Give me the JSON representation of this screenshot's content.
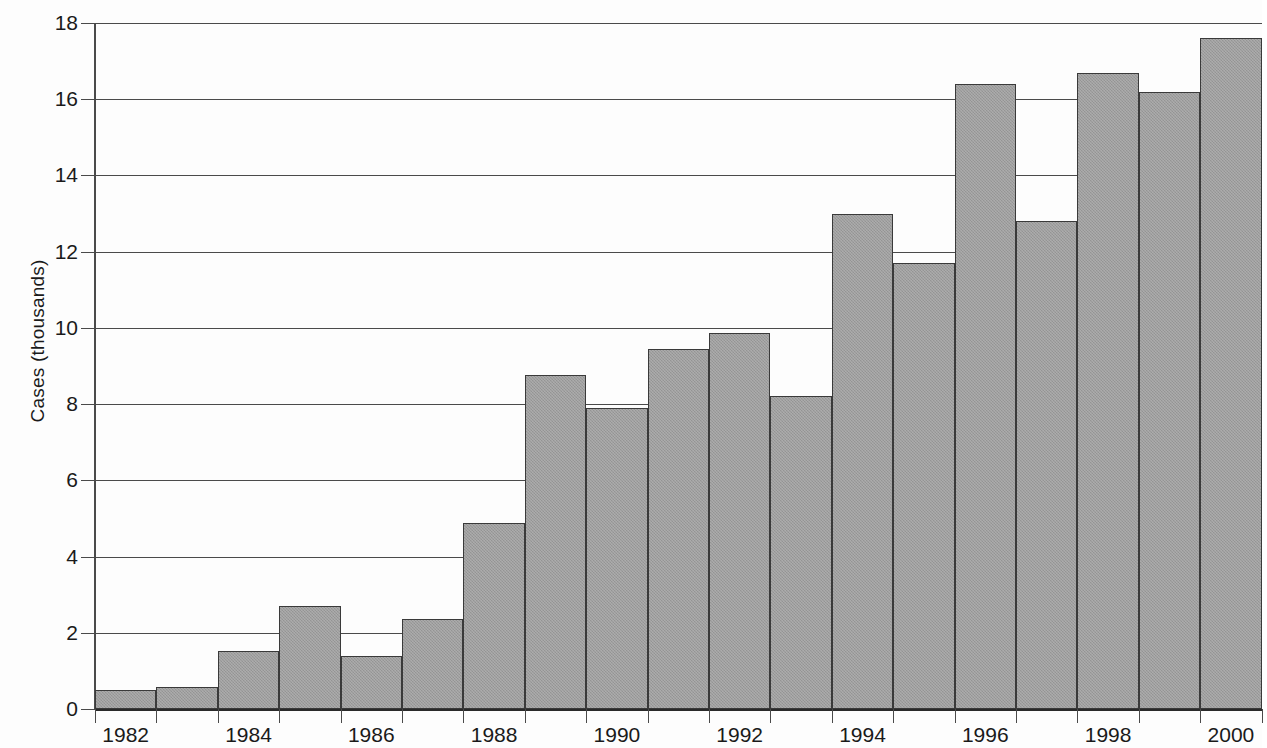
{
  "chart_data": {
    "type": "bar",
    "title": "",
    "xlabel": "",
    "ylabel": "Cases (thousands)",
    "ylim": [
      0,
      18
    ],
    "y_ticks": [
      0,
      2,
      4,
      6,
      8,
      10,
      12,
      14,
      16,
      18
    ],
    "y_tick_labels": [
      "0",
      "2",
      "4",
      "6",
      "8",
      "10",
      "12",
      "14",
      "16",
      "18"
    ],
    "grid": "horizontal",
    "legend": "none",
    "note": "right-most bar (2000) is clipped by the image edge",
    "categories": [
      "1982",
      "1983",
      "1984",
      "1985",
      "1986",
      "1987",
      "1988",
      "1989",
      "1990",
      "1991",
      "1992",
      "1993",
      "1994",
      "1995",
      "1996",
      "1997",
      "1998",
      "1999",
      "2000"
    ],
    "x_tick_labels": [
      "1982",
      "1984",
      "1986",
      "1988",
      "1990",
      "1992",
      "1994",
      "1996",
      "1998",
      "2000"
    ],
    "values": [
      0.5,
      0.57,
      1.53,
      2.7,
      1.38,
      2.37,
      4.87,
      8.77,
      7.9,
      9.45,
      9.87,
      8.22,
      13.0,
      11.7,
      16.4,
      12.8,
      16.7,
      16.2,
      17.6
    ],
    "bar_color": "#9c9c9c",
    "bar_edge_color": "#3a3a3a",
    "axis_color": "#4a4a4a",
    "background_color": "#fdfdfd"
  }
}
